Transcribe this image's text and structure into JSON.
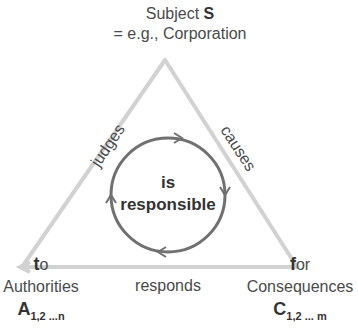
{
  "diagram": {
    "top": {
      "line1_prefix": "Subject ",
      "line1_symbol": "S",
      "line2": "= e.g., Corporation"
    },
    "left": {
      "prep_bold": "t",
      "prep_rest": "o",
      "name": "Authorities",
      "symbol": "A",
      "subscript": "1,2 ...n"
    },
    "right": {
      "prep_bold": "f",
      "prep_rest": "or",
      "name": "Consequences",
      "symbol": "C",
      "subscript": "1,2 ... m"
    },
    "edges": {
      "left": "judges",
      "right": "causes",
      "bottom": "responds"
    },
    "center": {
      "line1": "is",
      "line2": "responsible"
    },
    "colors": {
      "triangle": "#d2d2d2",
      "circle": "#707070",
      "text": "#4a4a4a"
    }
  }
}
